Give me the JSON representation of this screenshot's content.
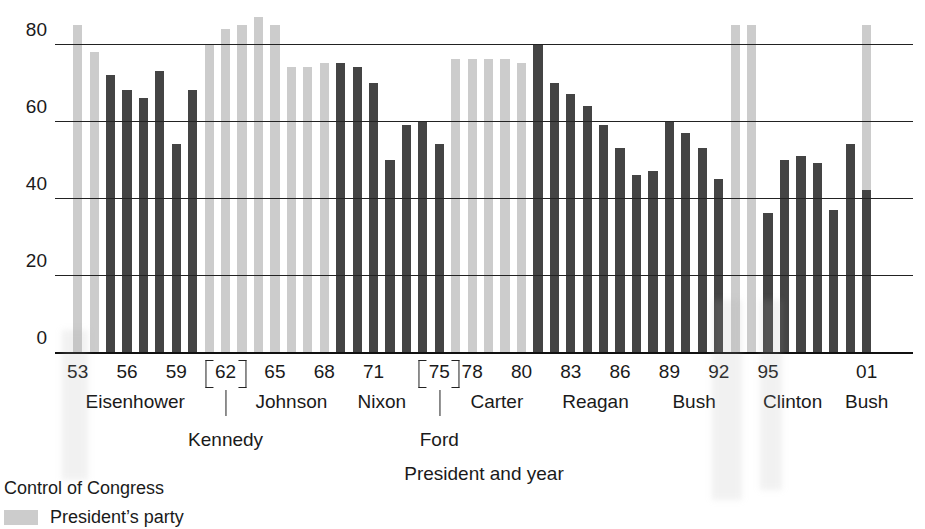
{
  "chart_data": {
    "type": "bar",
    "title": "",
    "xlabel": "President and year",
    "ylabel": "",
    "ylim": [
      0,
      88
    ],
    "yticks": [
      0,
      20,
      40,
      60,
      80
    ],
    "grid": true,
    "legend_position": "below-left",
    "series": [
      {
        "name": "President's party",
        "color": "#cccccc",
        "note": "Light background column marks years when the president's party controlled Congress"
      },
      {
        "name": "Presidential support score",
        "color": "#444444"
      }
    ],
    "x": [
      "53",
      "54",
      "55",
      "56",
      "57",
      "58",
      "59",
      "60",
      "61",
      "62",
      "63",
      "64",
      "65",
      "66",
      "67",
      "68",
      "69",
      "70",
      "71",
      "72",
      "73",
      "74",
      "75",
      "76",
      "77",
      "78",
      "79",
      "80",
      "81",
      "82",
      "83",
      "84",
      "85",
      "86",
      "87",
      "88",
      "89",
      "90",
      "91",
      "92",
      "93",
      "94",
      "95",
      "96",
      "97",
      "98",
      "99",
      "00",
      "01"
    ],
    "values": [
      85,
      78,
      72,
      68,
      66,
      73,
      54,
      68,
      80,
      84,
      85,
      87,
      85,
      74,
      74,
      75,
      75,
      74,
      70,
      50,
      59,
      60,
      54,
      76,
      76,
      76,
      76,
      75,
      80,
      70,
      67,
      64,
      59,
      53,
      46,
      47,
      60,
      57,
      53,
      45,
      85,
      85,
      36,
      50,
      51,
      49,
      37,
      54,
      42
    ],
    "control": [
      true,
      true,
      false,
      false,
      false,
      false,
      false,
      false,
      true,
      true,
      true,
      true,
      true,
      true,
      true,
      true,
      false,
      false,
      false,
      false,
      false,
      false,
      false,
      false,
      true,
      true,
      true,
      true,
      false,
      false,
      false,
      false,
      false,
      false,
      false,
      false,
      false,
      false,
      false,
      false,
      true,
      true,
      false,
      false,
      false,
      false,
      false,
      false,
      true
    ],
    "control_top": [
      85,
      78,
      0,
      0,
      0,
      0,
      0,
      0,
      80,
      84,
      85,
      87,
      85,
      74,
      74,
      75,
      0,
      0,
      0,
      0,
      0,
      0,
      0,
      76,
      76,
      76,
      76,
      75,
      0,
      0,
      0,
      0,
      0,
      0,
      0,
      0,
      0,
      0,
      0,
      0,
      85,
      85,
      0,
      0,
      0,
      0,
      0,
      0,
      85
    ],
    "xtick_labels": [
      "53",
      "56",
      "59",
      "62",
      "65",
      "68",
      "71",
      "75",
      "78",
      "80",
      "83",
      "86",
      "89",
      "92",
      "95",
      "01"
    ],
    "xtick_indices": [
      0,
      3,
      6,
      9,
      12,
      15,
      18,
      22,
      24,
      27,
      30,
      33,
      36,
      39,
      42,
      48
    ],
    "braced_ticks": [
      "62",
      "75"
    ],
    "presidents": [
      {
        "name": "Eisenhower",
        "center_index": 3.5,
        "row": "upper"
      },
      {
        "name": "Kennedy",
        "center_index": 9.0,
        "row": "lower"
      },
      {
        "name": "Johnson",
        "center_index": 13.0,
        "row": "upper"
      },
      {
        "name": "Nixon",
        "center_index": 18.5,
        "row": "upper"
      },
      {
        "name": "Ford",
        "center_index": 22.0,
        "row": "lower"
      },
      {
        "name": "Carter",
        "center_index": 25.5,
        "row": "upper"
      },
      {
        "name": "Reagan",
        "center_index": 31.5,
        "row": "upper"
      },
      {
        "name": "Bush",
        "center_index": 37.5,
        "row": "upper"
      },
      {
        "name": "Clinton",
        "center_index": 43.5,
        "row": "upper"
      },
      {
        "name": "Bush",
        "center_index": 48.0,
        "row": "upper"
      }
    ]
  },
  "axis": {
    "x_title": "President and year",
    "yticks": [
      "80",
      "60",
      "40",
      "20",
      "0"
    ]
  },
  "legend": {
    "title": "Control of Congress",
    "items": [
      {
        "label": "President’s party",
        "color": "#cccccc"
      }
    ]
  }
}
